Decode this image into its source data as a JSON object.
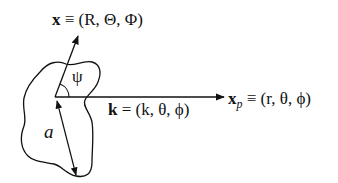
{
  "diagram": {
    "labels": {
      "x_vector": {
        "symbol": "x",
        "equiv": "≡",
        "coords": "(R, Θ, Φ)"
      },
      "k_vector": {
        "symbol": "k",
        "equals": "=",
        "coords": "(k, θ, ϕ)"
      },
      "xp_vector": {
        "symbol": "x",
        "subscript": "p",
        "equiv": "≡",
        "coords": "(r, θ, ϕ)"
      },
      "angle": "ψ",
      "size": "a"
    },
    "colors": {
      "stroke": "#111111",
      "background": "#ffffff"
    }
  }
}
